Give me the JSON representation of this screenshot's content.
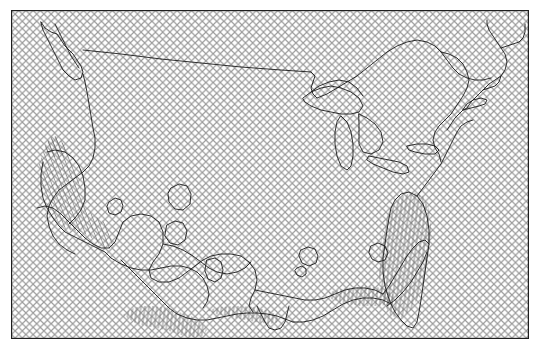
{
  "figure": {
    "title": "",
    "background_color": "#ffffff",
    "width": 542,
    "height": 354
  },
  "axes": {
    "name": "map-axes",
    "x": 11,
    "y": 10,
    "width": 518,
    "height": 329,
    "frame_color": "#1f1f1f",
    "frame_width": 1.2,
    "xlabel": "",
    "ylabel": "",
    "xticks": [],
    "yticks": [],
    "xticklabels": [],
    "yticklabels": [],
    "grid": false
  },
  "chart_data": {
    "type": "map",
    "title": "",
    "subtitle": "",
    "xlabel": "",
    "ylabel": "",
    "projection": "lambert-conformal-conic",
    "region": "contiguous-united-states",
    "grid": false,
    "legend": null,
    "annotations": [],
    "layers": [
      {
        "name": "significance-crosshatch",
        "type": "hatch-fill",
        "hatch": "xx",
        "hatch_color": "#9a9a9a",
        "face_color": "#ffffff",
        "coverage": "full-axes",
        "description": "crosshatch stippling covering entire map domain"
      },
      {
        "name": "coastline",
        "type": "line",
        "color": "#1a1a1a",
        "linewidth": 0.9
      },
      {
        "name": "national-border",
        "type": "line",
        "color": "#1a1a1a",
        "linewidth": 0.9
      },
      {
        "name": "contour-lines",
        "type": "contour",
        "color": "#1a1a1a",
        "linewidth": 0.9,
        "levels": [],
        "filled": false
      },
      {
        "name": "hatched-anomaly-regions",
        "type": "hatch-fill",
        "hatch": "|||",
        "hatch_color": "#6e6e6e",
        "face_color": "none",
        "regions": [
          "california",
          "texas-gulf-coast",
          "florida"
        ]
      }
    ]
  }
}
